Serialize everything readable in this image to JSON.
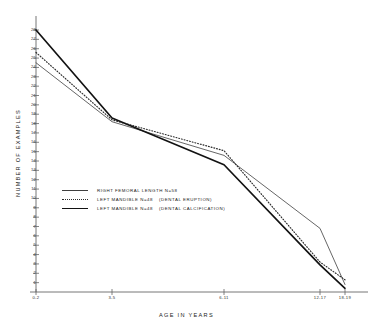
{
  "chart_data": {
    "type": "line",
    "title": "",
    "xlabel": "AGE IN YEARS",
    "ylabel": "NUMBER OF EXAMPLES",
    "categories": [
      "0-2",
      "3-5",
      "6-11",
      "12-17",
      "18-19"
    ],
    "x_positions": [
      36,
      112,
      224,
      320,
      345
    ],
    "ylim": [
      0,
      28
    ],
    "yticks": [
      28,
      27,
      26,
      25,
      24,
      23,
      22,
      21,
      20,
      19,
      18,
      17,
      16,
      15,
      14,
      13,
      12,
      11,
      10,
      9,
      8,
      7,
      6,
      5,
      4,
      3,
      2,
      1
    ],
    "grid": false,
    "legend_position": "center-left",
    "series": [
      {
        "name": "RIGHT FEMORAL LENGTH",
        "n_label": "N=58",
        "paren": "",
        "style": "thin-solid",
        "color": "#3f3f3f",
        "values": [
          24.5,
          18.2,
          14.6,
          6.8,
          0.8
        ]
      },
      {
        "name": "LEFT MANDIBLE",
        "n_label": "N=48",
        "paren": "(DENTAL ERUPTION)",
        "style": "dotted",
        "color": "#2b2b2b",
        "values": [
          25.6,
          18.4,
          15.1,
          3.2,
          1.3
        ]
      },
      {
        "name": "LEFT MANDIBLE",
        "n_label": "N=48",
        "paren": "(DENTAL CALCIFICATION)",
        "style": "bold-solid",
        "color": "#121212",
        "values": [
          28.0,
          18.6,
          13.6,
          2.9,
          0.4
        ]
      }
    ]
  },
  "legend": {
    "rows": [
      {
        "label": "RIGHT FEMORAL LENGTH  N=58",
        "paren": ""
      },
      {
        "label": "LEFT MANDIBLE  N=48",
        "paren": "(DENTAL ERUPTION)"
      },
      {
        "label": "LEFT MANDIBLE  N=48",
        "paren": "(DENTAL CALCIFICATION)"
      }
    ]
  }
}
